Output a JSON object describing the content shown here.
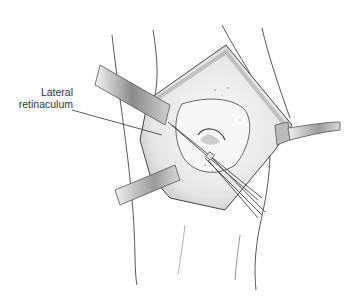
{
  "figure": {
    "labels": [
      {
        "line1": "Lateral",
        "line2": "retinaculum"
      }
    ]
  }
}
